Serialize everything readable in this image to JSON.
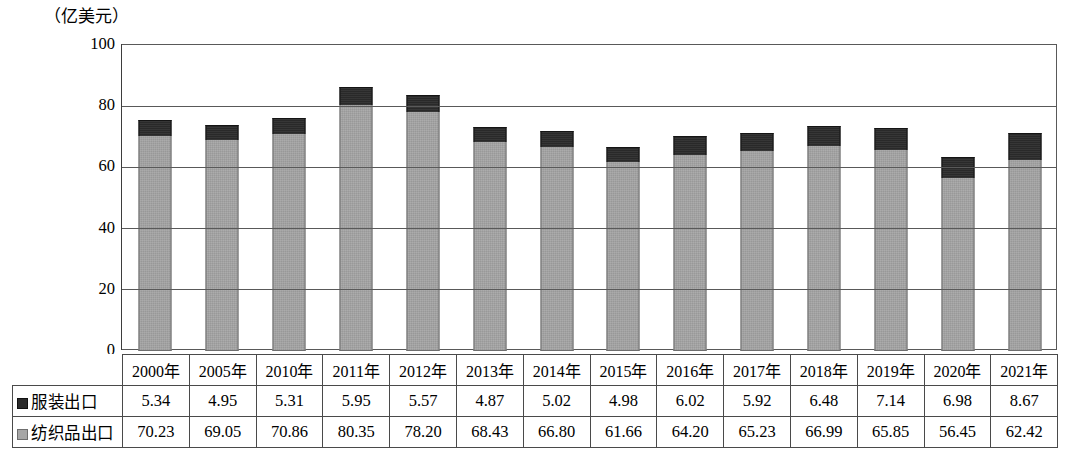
{
  "unit_label": "（亿美元）",
  "chart_data": {
    "type": "bar",
    "subtype": "stacked-bar",
    "title": "",
    "subtitle": "",
    "xlabel": "",
    "ylabel": "（亿美元）",
    "ylim": [
      0,
      100
    ],
    "yticks": [
      0,
      20,
      40,
      60,
      80,
      100
    ],
    "ytick_labels": [
      "0",
      "20",
      "40",
      "60",
      "80",
      "100"
    ],
    "grid": true,
    "grid_axis": "y",
    "legend_position": "table-row-labels",
    "categories": [
      "2000年",
      "2005年",
      "2010年",
      "2011年",
      "2012年",
      "2013年",
      "2014年",
      "2015年",
      "2016年",
      "2017年",
      "2018年",
      "2019年",
      "2020年",
      "2021年"
    ],
    "series": [
      {
        "name": "服装出口",
        "color": "#2b2b2b",
        "stack_position": "top",
        "values": [
          5.34,
          4.95,
          5.31,
          5.95,
          5.57,
          4.87,
          5.02,
          4.98,
          6.02,
          5.92,
          6.48,
          7.14,
          6.98,
          8.67
        ]
      },
      {
        "name": "纺织品出口",
        "color": "#a6a6a6",
        "stack_position": "bottom",
        "values": [
          70.23,
          69.05,
          70.86,
          80.35,
          78.2,
          68.43,
          66.8,
          61.66,
          64.2,
          65.23,
          66.99,
          65.85,
          56.45,
          62.42
        ]
      }
    ],
    "totals": [
      75.57,
      74.0,
      76.17,
      86.3,
      83.77,
      73.3,
      71.82,
      66.64,
      70.22,
      71.15,
      73.47,
      72.99,
      63.43,
      71.09
    ]
  },
  "table": {
    "header_row": [
      "",
      "2000年",
      "2005年",
      "2010年",
      "2011年",
      "2012年",
      "2013年",
      "2014年",
      "2015年",
      "2016年",
      "2017年",
      "2018年",
      "2019年",
      "2020年",
      "2021年"
    ],
    "rows": [
      {
        "label": "服装出口",
        "marker": "dark-square-legend-icon",
        "cells": [
          "5.34",
          "4.95",
          "5.31",
          "5.95",
          "5.57",
          "4.87",
          "5.02",
          "4.98",
          "6.02",
          "5.92",
          "6.48",
          "7.14",
          "6.98",
          "8.67"
        ]
      },
      {
        "label": "纺织品出口",
        "marker": "gray-square-legend-icon",
        "cells": [
          "70.23",
          "69.05",
          "70.86",
          "80.35",
          "78.20",
          "68.43",
          "66.80",
          "61.66",
          "64.20",
          "65.23",
          "66.99",
          "65.85",
          "56.45",
          "62.42"
        ]
      }
    ]
  },
  "colors": {
    "apparel": "#2b2b2b",
    "textile": "#a6a6a6",
    "axis": "#595959",
    "border": "#4a4a4a",
    "background": "#ffffff"
  }
}
